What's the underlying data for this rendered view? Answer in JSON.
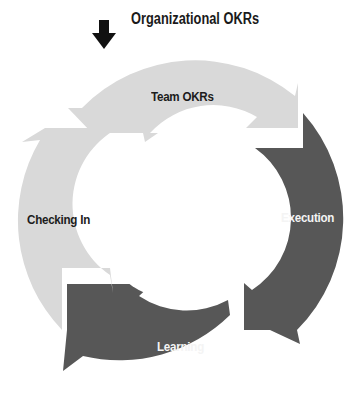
{
  "diagram": {
    "type": "cycle",
    "input": {
      "label": "Organizational OKRs",
      "icon": "down-arrow-icon"
    },
    "stages": [
      {
        "label": "Team OKRs",
        "shade": "light",
        "color": "#d9d9d9"
      },
      {
        "label": "Execution",
        "shade": "dark",
        "color": "#575757"
      },
      {
        "label": "Learning",
        "shade": "dark",
        "color": "#575757"
      },
      {
        "label": "Checking In",
        "shade": "light",
        "color": "#d9d9d9"
      }
    ],
    "direction": "clockwise",
    "colors": {
      "light": "#d9d9d9",
      "dark": "#575757",
      "background": "#ffffff",
      "arrow": "#111111"
    }
  }
}
